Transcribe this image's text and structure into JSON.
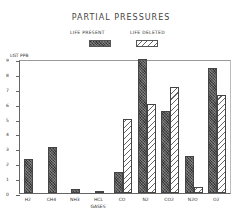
{
  "chart_data": {
    "type": "bar",
    "title": "PARTIAL PRESSURES",
    "xlabel": "GASES",
    "ylabel": "LGT PPB",
    "ylim": [
      0,
      9
    ],
    "yticks": [
      0,
      1,
      2,
      3,
      4,
      5,
      6,
      7,
      8,
      9
    ],
    "grid": false,
    "legend_position": "top-center",
    "categories": [
      "H2",
      "CH4",
      "NH3",
      "HCL",
      "CO",
      "N2",
      "CO2",
      "N2O",
      "O2"
    ],
    "series": [
      {
        "name": "LIFE PRESENT",
        "pattern": "crosshatch-dark",
        "values": [
          2.3,
          3.1,
          0.25,
          0.15,
          1.4,
          9.0,
          5.5,
          2.5,
          8.4
        ]
      },
      {
        "name": "LIFE DELETED",
        "pattern": "diagonal-hatch",
        "values": [
          null,
          null,
          null,
          null,
          5.0,
          6.0,
          7.1,
          0.4,
          6.6
        ]
      }
    ]
  }
}
